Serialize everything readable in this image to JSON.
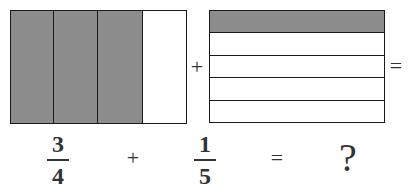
{
  "figure": {
    "left_model": {
      "parts": 4,
      "shaded": 3,
      "orientation": "vertical",
      "shade_color": "#8c8c8c"
    },
    "right_model": {
      "parts": 5,
      "shaded": 1,
      "orientation": "horizontal",
      "shade_color": "#8c8c8c"
    },
    "top_plus": "+",
    "top_equals": "=",
    "equation": {
      "fraction1": {
        "numerator": "3",
        "denominator": "4"
      },
      "plus": "+",
      "fraction2": {
        "numerator": "1",
        "denominator": "5"
      },
      "equals": "=",
      "unknown": "?"
    }
  }
}
